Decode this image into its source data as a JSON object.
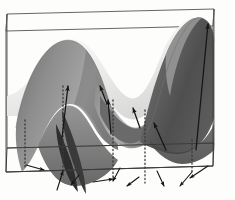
{
  "figure": {
    "background_color": "#fdfdfb",
    "box": {
      "name": "bounding-box",
      "stroke_color": "#4a4a4a",
      "stroke_width": 0.9,
      "vertices": {
        "back_top_left": [
          7,
          14
        ],
        "back_top_right": [
          214,
          9
        ],
        "front_top_left": [
          6,
          31
        ],
        "front_top_right": [
          213,
          26
        ],
        "back_bottom_left": [
          7,
          148
        ],
        "back_bottom_right": [
          214,
          143
        ],
        "front_bottom_left": [
          6,
          172
        ],
        "front_bottom_right": [
          213,
          166
        ]
      }
    },
    "surface": {
      "name": "wavy-surface",
      "shading": "grayscale diffuse",
      "light_color": "#f6f6f4",
      "mid_color": "#9b9b9b",
      "dark_color": "#4e4e4e",
      "outline_color": "#6b6b6b",
      "peaks": [
        {
          "label": "left-peak",
          "apex": [
            68,
            44
          ],
          "tone": "mid-gray"
        },
        {
          "label": "right-peak",
          "apex": [
            180,
            20
          ],
          "tone": "dark-gray"
        }
      ],
      "saddle": {
        "label": "central-saddle",
        "center": [
          128,
          96
        ],
        "tone": "bright-white"
      },
      "valleys": [
        {
          "label": "left-valley",
          "base": [
            52,
            160
          ]
        },
        {
          "label": "center-valley",
          "base": [
            118,
            140
          ]
        },
        {
          "label": "right-valley",
          "base": [
            168,
            155
          ]
        }
      ]
    },
    "surface_arrows": {
      "name": "gradient-vectors-on-surface",
      "color": "#151515",
      "count": 6,
      "items": [
        {
          "x1": 62,
          "y1": 138,
          "x2": 68,
          "y2": 86
        },
        {
          "x1": 107,
          "y1": 104,
          "x2": 100,
          "y2": 86
        },
        {
          "x1": 111,
          "y1": 134,
          "x2": 108,
          "y2": 100
        },
        {
          "x1": 140,
          "y1": 128,
          "x2": 133,
          "y2": 108
        },
        {
          "x1": 166,
          "y1": 150,
          "x2": 154,
          "y2": 123
        },
        {
          "x1": 196,
          "y1": 150,
          "x2": 208,
          "y2": 24
        }
      ]
    },
    "base_arrows": {
      "name": "projected-vectors-on-base-plane",
      "color": "#151515",
      "count": 9,
      "items": [
        {
          "x1": 26,
          "y1": 165,
          "x2": 44,
          "y2": 170
        },
        {
          "x1": 57,
          "y1": 190,
          "x2": 63,
          "y2": 171
        },
        {
          "x1": 79,
          "y1": 175,
          "x2": 71,
          "y2": 185
        },
        {
          "x1": 93,
          "y1": 182,
          "x2": 113,
          "y2": 179
        },
        {
          "x1": 120,
          "y1": 168,
          "x2": 113,
          "y2": 181
        },
        {
          "x1": 139,
          "y1": 177,
          "x2": 127,
          "y2": 186
        },
        {
          "x1": 157,
          "y1": 171,
          "x2": 164,
          "y2": 186
        },
        {
          "x1": 192,
          "y1": 172,
          "x2": 180,
          "y2": 186
        },
        {
          "x1": 208,
          "y1": 166,
          "x2": 190,
          "y2": 178
        }
      ]
    },
    "projection_lines": {
      "name": "dotted-projection-lines",
      "color": "#3a3a3a",
      "style": "dotted",
      "count": 5,
      "items": [
        {
          "x": 25,
          "y1": 120,
          "y2": 167
        },
        {
          "x": 63,
          "y1": 86,
          "y2": 171
        },
        {
          "x": 113,
          "y1": 100,
          "y2": 180
        },
        {
          "x": 145,
          "y1": 110,
          "y2": 183
        },
        {
          "x": 192,
          "y1": 140,
          "y2": 172
        }
      ]
    }
  }
}
